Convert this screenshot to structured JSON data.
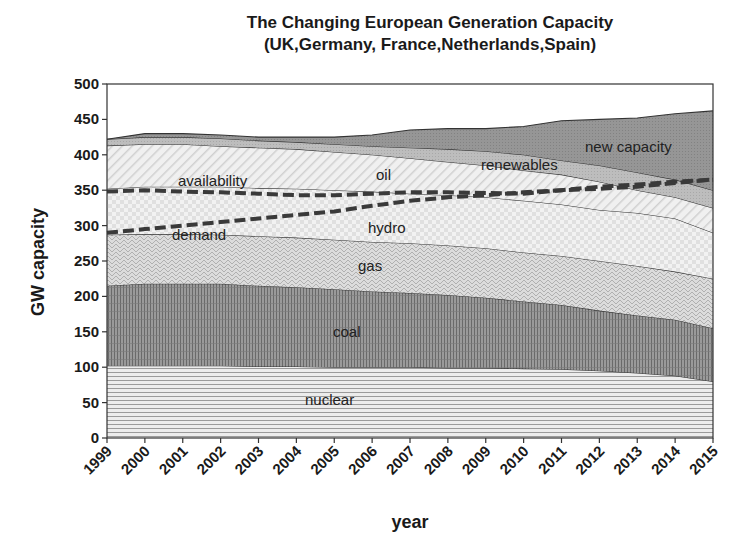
{
  "title": {
    "line1": "The Changing European Generation Capacity",
    "line2": "(UK,Germany, France,Netherlands,Spain)"
  },
  "axes": {
    "xlabel": "year",
    "ylabel": "GW capacity",
    "yticks": [
      "0",
      "50",
      "100",
      "150",
      "200",
      "250",
      "300",
      "350",
      "400",
      "450",
      "500"
    ],
    "xticks": [
      "1999",
      "2000",
      "2001",
      "2002",
      "2003",
      "2004",
      "2005",
      "2006",
      "2007",
      "2008",
      "2009",
      "2010",
      "2011",
      "2012",
      "2013",
      "2014",
      "2015"
    ]
  },
  "labels": {
    "nuclear": "nuclear",
    "coal": "coal",
    "gas": "gas",
    "hydro": "hydro",
    "oil": "oil",
    "renewables": "renewables",
    "new_capacity": "new capacity",
    "availability": "availability",
    "demand": "demand"
  },
  "colors": {
    "nuclear": "#e6e6e6",
    "coal": "#8c8c8c",
    "gas": "#d2d2d2",
    "hydro": "#ececec",
    "oil": "#e4e4e4",
    "renewables": "#b4b4b4",
    "new_capacity": "#8f8f8f",
    "line": "#333333",
    "dashed": "#3a3a3a"
  },
  "chart_data": {
    "type": "area",
    "stacked": true,
    "xlabel": "year",
    "ylabel": "GW capacity",
    "ylim": [
      0,
      500
    ],
    "ytick_step": 50,
    "grid": false,
    "legend": "inline labels",
    "categories": [
      1999,
      2000,
      2001,
      2002,
      2003,
      2004,
      2005,
      2006,
      2007,
      2008,
      2009,
      2010,
      2011,
      2012,
      2013,
      2014,
      2015
    ],
    "cumulative_tops": {
      "nuclear": [
        102,
        102,
        102,
        102,
        101,
        101,
        100,
        100,
        100,
        99,
        99,
        98,
        97,
        95,
        92,
        88,
        80
      ],
      "coal": [
        215,
        218,
        218,
        218,
        215,
        213,
        210,
        207,
        205,
        202,
        198,
        193,
        188,
        180,
        173,
        167,
        155
      ],
      "gas": [
        287,
        288,
        288,
        287,
        285,
        283,
        280,
        277,
        275,
        272,
        268,
        262,
        257,
        250,
        243,
        235,
        225
      ],
      "hydro": [
        352,
        355,
        355,
        355,
        353,
        352,
        350,
        348,
        345,
        343,
        340,
        335,
        330,
        322,
        318,
        310,
        290
      ],
      "oil": [
        413,
        415,
        415,
        412,
        410,
        408,
        404,
        400,
        395,
        390,
        385,
        378,
        372,
        362,
        350,
        340,
        325
      ],
      "renewables": [
        422,
        425,
        425,
        423,
        420,
        418,
        415,
        412,
        410,
        408,
        405,
        400,
        392,
        385,
        375,
        365,
        350
      ],
      "new_capacity": [
        422,
        430,
        430,
        428,
        425,
        425,
        425,
        428,
        435,
        437,
        437,
        440,
        448,
        450,
        452,
        458,
        462
      ]
    },
    "series": [
      {
        "name": "nuclear",
        "values": [
          102,
          102,
          102,
          102,
          101,
          101,
          100,
          100,
          100,
          99,
          99,
          98,
          97,
          95,
          92,
          88,
          80
        ]
      },
      {
        "name": "coal",
        "values": [
          113,
          116,
          116,
          116,
          114,
          112,
          110,
          107,
          105,
          103,
          99,
          95,
          91,
          85,
          81,
          79,
          75
        ]
      },
      {
        "name": "gas",
        "values": [
          72,
          70,
          70,
          69,
          70,
          70,
          70,
          70,
          70,
          70,
          70,
          69,
          69,
          70,
          70,
          68,
          70
        ]
      },
      {
        "name": "hydro",
        "values": [
          65,
          67,
          67,
          68,
          68,
          69,
          70,
          71,
          70,
          71,
          72,
          73,
          73,
          72,
          75,
          75,
          65
        ]
      },
      {
        "name": "oil",
        "values": [
          61,
          60,
          60,
          57,
          57,
          56,
          54,
          52,
          50,
          47,
          45,
          43,
          42,
          40,
          32,
          30,
          35
        ]
      },
      {
        "name": "renewables",
        "values": [
          9,
          10,
          10,
          11,
          10,
          10,
          11,
          12,
          15,
          18,
          20,
          22,
          20,
          23,
          25,
          25,
          25
        ]
      },
      {
        "name": "new capacity",
        "values": [
          0,
          5,
          5,
          5,
          5,
          7,
          10,
          16,
          25,
          29,
          32,
          40,
          56,
          65,
          77,
          93,
          112
        ]
      }
    ],
    "lines": [
      {
        "name": "availability",
        "style": "dashed",
        "values": [
          348,
          350,
          348,
          347,
          345,
          343,
          343,
          345,
          347,
          347,
          346,
          345,
          350,
          355,
          358,
          362,
          365
        ]
      },
      {
        "name": "demand",
        "style": "dashed",
        "values": [
          290,
          295,
          300,
          305,
          310,
          315,
          320,
          328,
          335,
          340,
          343,
          347,
          350,
          352,
          355,
          360,
          365
        ]
      }
    ]
  }
}
